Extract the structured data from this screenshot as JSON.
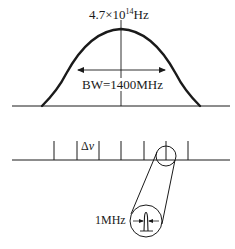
{
  "diagram": {
    "gain_curve": {
      "center_frequency_label": {
        "mantissa": "4.7×10",
        "exponent": "14",
        "unit": "Hz"
      },
      "bandwidth_label": "BW=1400MHz"
    },
    "mode_comb": {
      "spacing_symbol": "Δ",
      "spacing_var": "ν",
      "tick_count": 7
    },
    "zoom_inset": {
      "linewidth_label": "1MHz"
    },
    "colors": {
      "stroke": "#1a1a1a",
      "background": "#ffffff"
    }
  }
}
